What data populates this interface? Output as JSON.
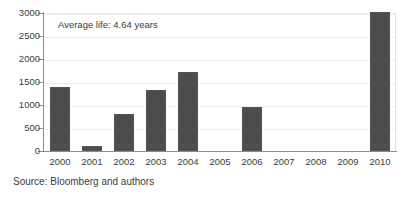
{
  "chart_data": {
    "type": "bar",
    "title": "",
    "subtitle": "",
    "xlabel": "",
    "ylabel": "",
    "categories": [
      "2000",
      "2001",
      "2002",
      "2003",
      "2004",
      "2005",
      "2006",
      "2007",
      "2008",
      "2009",
      "2010"
    ],
    "values": [
      1400,
      110,
      800,
      1330,
      1720,
      0,
      960,
      0,
      0,
      0,
      3030
    ],
    "series": [
      {
        "name": "",
        "values": [
          1400,
          110,
          800,
          1330,
          1720,
          0,
          960,
          0,
          0,
          0,
          3030
        ]
      }
    ],
    "ylim": [
      0,
      3000
    ],
    "yticks": [
      0,
      500,
      1000,
      1500,
      2000,
      2500,
      3000
    ],
    "ytick_labels": [
      "0",
      "500",
      "1000",
      "1500",
      "2000",
      "2500",
      "3000"
    ],
    "grid": true,
    "grid_axis": "y",
    "legend": false,
    "legend_position": "none",
    "bar_color": "#4d4d4d",
    "annotations": [
      {
        "text": "Average life: 4.64 years",
        "x": "2000",
        "y": 2750
      }
    ]
  },
  "annotation": {
    "text": "Average life: 4.64 years"
  },
  "source": {
    "text": "Source: Bloomberg and authors"
  },
  "colors": {
    "bar": "#4d4d4d",
    "axis": "#8c8c8c",
    "grid": "#ededed",
    "text": "#3c3c3c",
    "background": "#ffffff"
  }
}
